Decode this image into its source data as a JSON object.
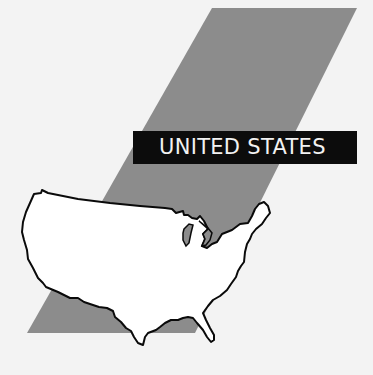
{
  "figure": {
    "title": "UNITED STATES",
    "colors": {
      "background": "#f3f3f3",
      "band": "#8c8c8c",
      "label_bg": "#0c0c0c",
      "label_text": "#f2f2f2",
      "map_fill": "#ffffff",
      "map_stroke": "#0a0a0a",
      "great_lakes_fill": "#8c8c8c"
    }
  }
}
